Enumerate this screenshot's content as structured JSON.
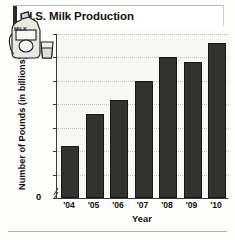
{
  "title": "U.S. Milk Production",
  "illustration": {
    "name": "milk-jug-and-glass",
    "carton_label": "MILK"
  },
  "axis_break": {
    "zero_label": "0",
    "symbol": "double-slash"
  },
  "chart_data": {
    "type": "bar",
    "title": "U.S. Milk Production",
    "xlabel": "Year",
    "ylabel": "Number of Pounds (in billions)",
    "categories": [
      "'04",
      "'05",
      "'06",
      "'07",
      "'08",
      "'09",
      "'10"
    ],
    "values": [
      171,
      178,
      181,
      185,
      190,
      189,
      193
    ],
    "ylim": [
      160,
      195
    ],
    "yticks": [
      160,
      165,
      170,
      175,
      180,
      185,
      190,
      195
    ],
    "ytick_labels": [
      "160",
      "165",
      "170",
      "175",
      "180",
      "185",
      "190",
      "195"
    ],
    "grid": true,
    "legend": "none",
    "bar_color": "#32322f",
    "plot_background": "#f7f7f3"
  }
}
